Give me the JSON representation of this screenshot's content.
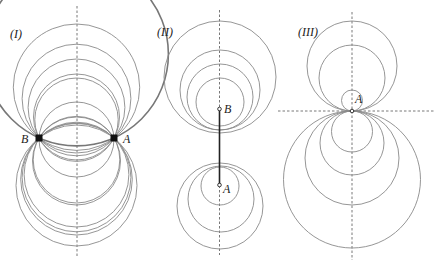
{
  "figure": {
    "panels": [
      {
        "id": "I",
        "label": "(I)",
        "points": [
          {
            "name": "B",
            "x": 39,
            "y": 138
          },
          {
            "name": "A",
            "x": 114,
            "y": 138
          }
        ],
        "axis_x": 77,
        "description": "Family of circles passing through both points A and B"
      },
      {
        "id": "II",
        "label": "(II)",
        "points": [
          {
            "name": "B",
            "x": 219,
            "y": 109
          },
          {
            "name": "A",
            "x": 219,
            "y": 185
          }
        ],
        "axis_x": 219,
        "description": "Non-intersecting circle families around limit points A and B"
      },
      {
        "id": "III",
        "label": "(III)",
        "points": [
          {
            "name": "A",
            "x": 352,
            "y": 111
          }
        ],
        "axis_x": 352,
        "axis_y": 111,
        "description": "Circles mutually tangent at point A"
      }
    ],
    "labels": {
      "panel1": "(I)",
      "panel2": "(II)",
      "panel3": "(III)",
      "p1_B": "B",
      "p1_A": "A",
      "p2_B": "B",
      "p2_A": "A",
      "p3_A": "A"
    }
  }
}
